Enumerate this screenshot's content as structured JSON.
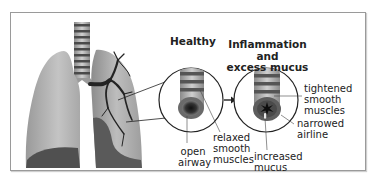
{
  "diagram": {
    "panels": [
      {
        "id": "healthy",
        "title": "Healthy",
        "labels": [
          {
            "id": "open-airway",
            "text": "open\nairway"
          },
          {
            "id": "relaxed-smooth-muscles",
            "text": "relaxed\nsmooth\nmuscles"
          }
        ]
      },
      {
        "id": "inflamed",
        "title": "Inflammation and\nexcess mucus",
        "labels": [
          {
            "id": "tightened-smooth-muscles",
            "text": "tightened\nsmooth\nmuscles"
          },
          {
            "id": "narrowed-airline",
            "text": "narrowed\nairline"
          },
          {
            "id": "increased-mucus",
            "text": "increased\nmucus"
          }
        ]
      }
    ],
    "colors": {
      "frame": "#9a9a9a",
      "lung_light": "#b8b8b8",
      "lung_dark": "#555555",
      "bronchi": "#2a2a2a",
      "airway_band": "#5a5a5a",
      "airway_tube": "#a8a8a8",
      "outline": "#222222"
    }
  }
}
